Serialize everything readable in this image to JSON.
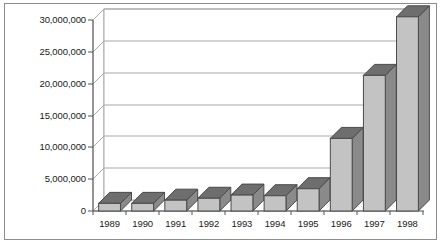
{
  "chart_data": {
    "type": "bar",
    "title": "",
    "subtitle": "",
    "xlabel": "",
    "ylabel": "",
    "categories": [
      "1989",
      "1990",
      "1991",
      "1992",
      "1993",
      "1994",
      "1995",
      "1996",
      "1997",
      "1998"
    ],
    "values": [
      1200000,
      1200000,
      1700000,
      2000000,
      2500000,
      2400000,
      3500000,
      11400000,
      21300000,
      30500000
    ],
    "series": [
      {
        "name": "Series 1",
        "values": [
          1200000,
          1200000,
          1700000,
          2000000,
          2500000,
          2400000,
          3500000,
          11400000,
          21300000,
          30500000
        ]
      }
    ],
    "ylim": [
      0,
      30000000
    ],
    "ytick_values": [
      0,
      5000000,
      10000000,
      15000000,
      20000000,
      25000000,
      30000000
    ],
    "ytick_labels": [
      "0",
      "5,000,000",
      "10,000,000",
      "15,000,000",
      "20,000,000",
      "25,000,000",
      "30,000,000"
    ],
    "grid": true,
    "grid_axis": "y",
    "legend": false,
    "legend_position": "none",
    "style": "3d-column",
    "colors": {
      "bar_front": "#c3c3c3",
      "bar_side": "#8a8a8a",
      "bar_top": "#6e6e6e",
      "bar_outline": "#4a4a4a",
      "gridline": "#a9a9a9",
      "axis": "#555555",
      "plot_background": "#ffffff",
      "frame_border": "#8d8d8d",
      "text": "#1a1a1a"
    }
  }
}
